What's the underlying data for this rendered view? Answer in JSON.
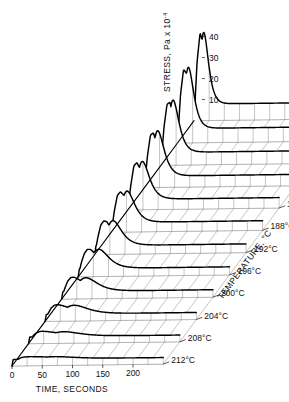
{
  "chart_data": {
    "type": "line",
    "title": "",
    "subtitle": "",
    "projection": "3d-waterfall",
    "xlabel": "TIME, SECONDS",
    "ylabel": "TEMPERATURE, °C",
    "zlabel": "STRESS, Pa x 10",
    "zlabel_exponent": "-4",
    "xlim": [
      0,
      250
    ],
    "zlim": [
      0,
      45
    ],
    "grid": true,
    "legend": "none",
    "x_ticks": [
      "0",
      "50",
      "100",
      "150",
      "200"
    ],
    "x_tick_values": [
      0,
      50,
      100,
      150,
      200
    ],
    "z_ticks": [
      "10",
      "20",
      "30",
      "40"
    ],
    "z_tick_values": [
      10,
      20,
      30,
      40
    ],
    "series_labels": [
      "168°C",
      "172°C",
      "176°C",
      "180°C",
      "184°C",
      "188°C",
      "192°C",
      "196°C",
      "200°C",
      "204°C",
      "208°C",
      "212°C"
    ],
    "series_values": [
      168,
      172,
      176,
      180,
      184,
      188,
      192,
      196,
      200,
      204,
      208,
      212
    ],
    "x": [
      0,
      5,
      10,
      15,
      20,
      25,
      30,
      40,
      50,
      60,
      70,
      80,
      90,
      100,
      120,
      140,
      160,
      180,
      200,
      220,
      240
    ],
    "series": [
      {
        "name": "168°C",
        "peak_time": 16,
        "peak_stress": 42,
        "values": [
          0,
          28,
          42,
          36,
          24,
          17,
          13,
          9.5,
          8.0,
          7.0,
          6.4,
          6.0,
          5.7,
          5.5,
          5.2,
          5.0,
          4.9,
          4.8,
          4.7,
          4.65,
          4.6
        ]
      },
      {
        "name": "172°C",
        "peak_time": 18,
        "peak_stress": 36,
        "values": [
          0,
          23,
          35,
          33,
          23,
          16.5,
          12.8,
          9.2,
          7.6,
          6.6,
          6.0,
          5.6,
          5.3,
          5.1,
          4.8,
          4.6,
          4.5,
          4.45,
          4.4,
          4.35,
          4.3
        ]
      },
      {
        "name": "176°C",
        "peak_time": 20,
        "peak_stress": 31,
        "values": [
          0,
          18,
          29,
          30,
          22,
          16,
          12.4,
          8.9,
          7.3,
          6.3,
          5.7,
          5.3,
          5.05,
          4.85,
          4.55,
          4.4,
          4.3,
          4.2,
          4.15,
          4.1,
          4.05
        ]
      },
      {
        "name": "180°C",
        "peak_time": 22,
        "peak_stress": 27,
        "values": [
          0,
          15,
          25,
          26,
          21,
          15.5,
          12,
          8.6,
          7.0,
          6.0,
          5.4,
          5.05,
          4.8,
          4.6,
          4.3,
          4.15,
          4.05,
          3.95,
          3.9,
          3.85,
          3.8
        ]
      },
      {
        "name": "184°C",
        "peak_time": 24,
        "peak_stress": 23,
        "values": [
          0,
          12,
          21,
          22.5,
          19.5,
          15,
          11.6,
          8.3,
          6.8,
          5.8,
          5.2,
          4.85,
          4.6,
          4.4,
          4.1,
          3.95,
          3.85,
          3.78,
          3.72,
          3.68,
          3.65
        ]
      },
      {
        "name": "188°C",
        "peak_time": 26,
        "peak_stress": 19.5,
        "values": [
          0,
          10,
          17.5,
          19.2,
          17.8,
          14.2,
          11.2,
          8.0,
          6.5,
          5.6,
          5.0,
          4.65,
          4.4,
          4.2,
          3.95,
          3.8,
          3.7,
          3.62,
          3.57,
          3.53,
          3.5
        ]
      },
      {
        "name": "192°C",
        "peak_time": 30,
        "peak_stress": 16,
        "values": [
          0,
          8,
          14,
          16,
          15.5,
          13.2,
          10.8,
          7.7,
          6.3,
          5.4,
          4.85,
          4.5,
          4.25,
          4.08,
          3.82,
          3.68,
          3.58,
          3.5,
          3.45,
          3.42,
          3.4
        ]
      },
      {
        "name": "196°C",
        "peak_time": 34,
        "peak_stress": 13,
        "values": [
          0,
          6.5,
          11,
          13,
          13,
          11.8,
          10.2,
          7.4,
          6.05,
          5.2,
          4.7,
          4.35,
          4.12,
          3.95,
          3.72,
          3.58,
          3.48,
          3.4,
          3.36,
          3.33,
          3.3
        ]
      },
      {
        "name": "200°C",
        "peak_time": 40,
        "peak_stress": 10,
        "values": [
          0,
          5,
          8.5,
          10.2,
          10.4,
          9.8,
          8.9,
          7.0,
          5.8,
          5.0,
          4.5,
          4.2,
          4.0,
          3.85,
          3.62,
          3.5,
          3.4,
          3.33,
          3.28,
          3.25,
          3.22
        ]
      },
      {
        "name": "204°C",
        "peak_time": 48,
        "peak_stress": 7.5,
        "values": [
          0,
          3.8,
          6.3,
          7.6,
          7.9,
          7.7,
          7.3,
          6.3,
          5.4,
          4.8,
          4.35,
          4.08,
          3.88,
          3.73,
          3.53,
          3.42,
          3.33,
          3.27,
          3.22,
          3.19,
          3.16
        ]
      },
      {
        "name": "208°C",
        "peak_time": 58,
        "peak_stress": 5.5,
        "values": [
          0,
          2.8,
          4.5,
          5.4,
          5.8,
          5.8,
          5.7,
          5.3,
          4.9,
          4.5,
          4.2,
          3.98,
          3.8,
          3.67,
          3.48,
          3.37,
          3.29,
          3.23,
          3.18,
          3.15,
          3.12
        ]
      },
      {
        "name": "212°C",
        "peak_time": 70,
        "peak_stress": 4.2,
        "values": [
          0,
          2.0,
          3.2,
          3.9,
          4.2,
          4.3,
          4.35,
          4.3,
          4.2,
          4.05,
          3.9,
          3.78,
          3.66,
          3.57,
          3.42,
          3.32,
          3.25,
          3.2,
          3.15,
          3.12,
          3.1
        ]
      }
    ],
    "annotations": [
      "Sharp stress overshoot peak decreases and broadens with increasing temperature",
      "All curves originate at the time=0, stress=0 origin"
    ]
  },
  "axes": {
    "time_label": "TIME, SECONDS",
    "temp_label": "TEMPERATURE , °C",
    "stress_label": "STRESS, Pa x 10"
  },
  "colors": {
    "curve": "#000000",
    "grid": "#8a8a8a",
    "background": "#ffffff",
    "text": "#111111"
  }
}
